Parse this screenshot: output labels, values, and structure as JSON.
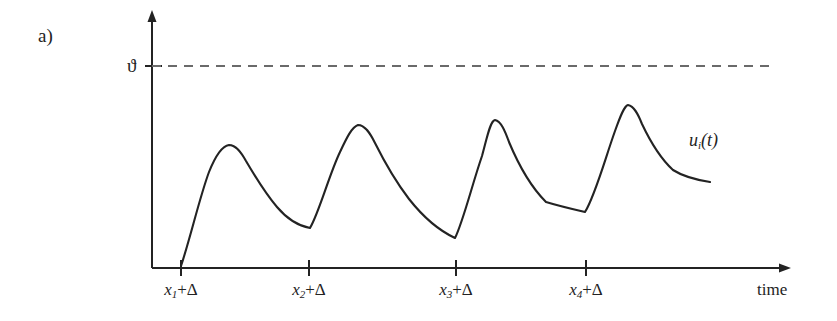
{
  "figure": {
    "panel_label": "a)",
    "threshold_symbol": "ϑ",
    "curve_label_base": "u",
    "curve_label_sub": "i",
    "curve_label_tail": "(t)",
    "x_axis_label": "time",
    "background_color": "#ffffff",
    "ink_color": "#232323"
  },
  "axes": {
    "x_axis": {
      "label": "time",
      "origin_px": 152,
      "baseline_y_px": 268,
      "arrow_tip_x_px": 790,
      "has_arrow": true
    },
    "y_axis": {
      "label": "",
      "x_px": 152,
      "arrow_tip_y_px": 12,
      "has_arrow": true
    }
  },
  "ticks": [
    {
      "label_base": "x",
      "label_sub": "1",
      "label_tail": "+Δ",
      "x_px": 181
    },
    {
      "label_base": "x",
      "label_sub": "2",
      "label_tail": "+Δ",
      "x_px": 309
    },
    {
      "label_base": "x",
      "label_sub": "3",
      "label_tail": "+Δ",
      "x_px": 456
    },
    {
      "label_base": "x",
      "label_sub": "4",
      "label_tail": "+Δ",
      "x_px": 586
    }
  ],
  "threshold": {
    "symbol": "ϑ",
    "y_px": 66,
    "x_start_px": 152,
    "x_end_px": 772,
    "style": "dashed",
    "dash_pattern": "9 7"
  },
  "chart_data": {
    "type": "line",
    "title": "",
    "subtitle": "",
    "xlabel": "time",
    "ylabel": "",
    "grid": false,
    "legend": [
      "u_i(t)"
    ],
    "legend_position": "inline-right",
    "annotations": [
      {
        "text": "a)",
        "role": "panel-label"
      },
      {
        "text": "ϑ",
        "role": "threshold-level"
      },
      {
        "text": "u_i(t)",
        "role": "curve-name"
      }
    ],
    "axis_note": "Pixel y decreases upward; smaller y_px = larger potential",
    "threshold_level_px": 66,
    "baseline_px": 268,
    "series": [
      {
        "name": "u_i(t)",
        "description": "Post-synaptic potential: four excitatory pulses, each rising steeply from a reset at x_k+Δ then decaying exponentially; peak amplitude grows with each successive pulse but never reaches threshold ϑ.",
        "color": "#232323",
        "stroke_width": 2.1,
        "reset_points_px": [
          {
            "x": 181,
            "y": 266
          },
          {
            "x": 310,
            "y": 228
          },
          {
            "x": 455,
            "y": 238
          },
          {
            "x": 585,
            "y": 212
          }
        ],
        "peaks_px": [
          {
            "x": 228,
            "y": 145
          },
          {
            "x": 357,
            "y": 125
          },
          {
            "x": 490,
            "y": 120
          },
          {
            "x": 625,
            "y": 105
          }
        ],
        "end_point_px": {
          "x": 710,
          "y": 182
        },
        "path": "M 181,266 C 190,239 200,196 209,172 C 215,157 222,146 229,145 C 236,145 241,152 246,161 C 256,178 266,194 277,207 C 288,220 299,226 310,228 C 319,213 329,175 340,152 C 347,137 352,127 358,125 C 365,125 370,133 375,143 C 385,163 396,182 409,199 C 424,218 440,231 455,238 C 463,222 472,185 482,156 C 487,138 490,121 495,120 C 501,121 505,131 509,142 C 519,166 531,187 546,202 C 559,206 572,209 585,212 C 595,196 605,159 615,131 C 620,117 624,106 628,105 C 634,106 638,114 642,124 C 651,143 661,159 673,170 C 684,177 697,180 710,182"
      }
    ]
  }
}
